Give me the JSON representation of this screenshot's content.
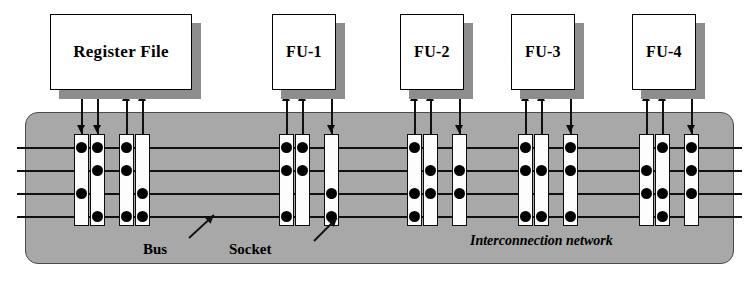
{
  "diagram": {
    "type": "block-diagram",
    "canvas": {
      "width": 753,
      "height": 283
    },
    "colors": {
      "network_fill": "#a8a8a8",
      "network_border": "#4a4a4a",
      "unit_fill": "#ffffff",
      "unit_shadow": "#8d8d8d",
      "line": "#101010",
      "socket_fill": "#fdfdfd",
      "dot": "#000000"
    },
    "units": [
      {
        "id": "register-file",
        "label": "Register File",
        "x": 50,
        "y": 14,
        "w": 142,
        "h": 76,
        "inputs": 2,
        "outputs": 2,
        "font_size": 17
      },
      {
        "id": "fu-1",
        "label": "FU-1",
        "x": 272,
        "y": 14,
        "w": 64,
        "h": 76,
        "inputs": 1,
        "outputs": 2,
        "font_size": 16
      },
      {
        "id": "fu-2",
        "label": "FU-2",
        "x": 400,
        "y": 14,
        "w": 64,
        "h": 76,
        "inputs": 1,
        "outputs": 2,
        "font_size": 16
      },
      {
        "id": "fu-3",
        "label": "FU-3",
        "x": 511,
        "y": 14,
        "w": 64,
        "h": 76,
        "inputs": 1,
        "outputs": 2,
        "font_size": 16
      },
      {
        "id": "fu-4",
        "label": "FU-4",
        "x": 632,
        "y": 14,
        "w": 64,
        "h": 76,
        "inputs": 1,
        "outputs": 2,
        "font_size": 16
      }
    ],
    "network": {
      "x": 25,
      "y": 112,
      "w": 707,
      "h": 150,
      "label": "Interconnection network",
      "label_x": 470,
      "label_y": 233,
      "label_font_size": 14
    },
    "buses": {
      "count": 4,
      "y_positions": [
        147,
        170,
        193,
        216
      ],
      "x_start": 17,
      "x_end": 742
    },
    "socket_geometry": {
      "top": 134,
      "height": 92,
      "width": 15,
      "dot_diameter": 11
    },
    "sockets": [
      {
        "id": "rf-out-a",
        "x": 74,
        "direction": "down",
        "lead_x": 81,
        "connections": [
          147,
          193
        ]
      },
      {
        "id": "rf-out-b",
        "x": 90,
        "direction": "down",
        "lead_x": 97,
        "connections": [
          147,
          170,
          216
        ]
      },
      {
        "id": "rf-in-a",
        "x": 119,
        "direction": "up",
        "lead_x": 126,
        "connections": [
          147,
          170,
          216
        ]
      },
      {
        "id": "rf-in-b",
        "x": 135,
        "direction": "up",
        "lead_x": 142,
        "connections": [
          193,
          216
        ]
      },
      {
        "id": "fu1-in-a",
        "x": 279,
        "direction": "up",
        "lead_x": 286,
        "connections": [
          147,
          170,
          216
        ]
      },
      {
        "id": "fu1-in-b",
        "x": 295,
        "direction": "up",
        "lead_x": 302,
        "connections": [
          147,
          170
        ]
      },
      {
        "id": "fu1-out",
        "x": 324,
        "direction": "down",
        "lead_x": 331,
        "connections": [
          193,
          216
        ]
      },
      {
        "id": "fu2-in-a",
        "x": 407,
        "direction": "up",
        "lead_x": 414,
        "connections": [
          147,
          193,
          216
        ]
      },
      {
        "id": "fu2-in-b",
        "x": 423,
        "direction": "up",
        "lead_x": 430,
        "connections": [
          170,
          193
        ]
      },
      {
        "id": "fu2-out",
        "x": 452,
        "direction": "down",
        "lead_x": 459,
        "connections": [
          170,
          193
        ]
      },
      {
        "id": "fu3-in-a",
        "x": 518,
        "direction": "up",
        "lead_x": 525,
        "connections": [
          147,
          170,
          216
        ]
      },
      {
        "id": "fu3-in-b",
        "x": 534,
        "direction": "up",
        "lead_x": 541,
        "connections": [
          170,
          216
        ]
      },
      {
        "id": "fu3-out",
        "x": 563,
        "direction": "down",
        "lead_x": 570,
        "connections": [
          147,
          170,
          216
        ]
      },
      {
        "id": "fu4-in-a",
        "x": 639,
        "direction": "up",
        "lead_x": 646,
        "connections": [
          170,
          193
        ]
      },
      {
        "id": "fu4-in-b",
        "x": 655,
        "direction": "up",
        "lead_x": 662,
        "connections": [
          147,
          193,
          216
        ]
      },
      {
        "id": "fu4-out",
        "x": 684,
        "direction": "down",
        "lead_x": 691,
        "connections": [
          147,
          170,
          193
        ]
      }
    ],
    "annotations": [
      {
        "id": "bus-label",
        "text": "Bus",
        "x": 143,
        "y": 241,
        "font_size": 15,
        "italic": false,
        "pointer": {
          "x1": 189,
          "y1": 238,
          "x2": 214,
          "y2": 215
        }
      },
      {
        "id": "socket-label",
        "text": "Socket",
        "x": 229,
        "y": 241,
        "font_size": 15,
        "italic": false,
        "pointer": {
          "x1": 314,
          "y1": 241,
          "x2": 337,
          "y2": 218
        }
      }
    ]
  }
}
